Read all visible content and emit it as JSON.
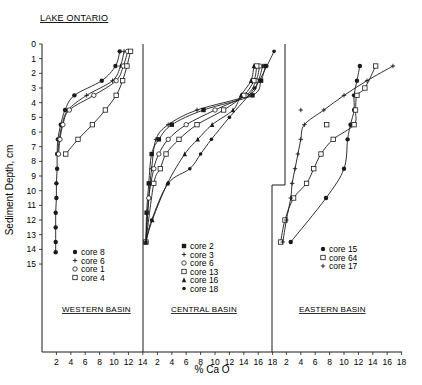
{
  "chart_data": {
    "type": "line",
    "title": "LAKE ONTARIO",
    "xlabel": "% Ca O",
    "ylabel": "Sediment Depth, cm",
    "y_ticks": [
      "0",
      "1",
      "2",
      "3",
      "4",
      "5",
      "6",
      "7",
      "8",
      "9",
      "10",
      "11",
      "12",
      "13",
      "14",
      "15"
    ],
    "ylim": [
      0,
      15
    ],
    "y_inverted": true,
    "grid": false,
    "panels": [
      {
        "name": "WESTERN BASIN",
        "x_ticks": [
          "2",
          "4",
          "6",
          "8",
          "10",
          "12",
          "14"
        ],
        "xlim": [
          0,
          14
        ],
        "series": [
          {
            "name": "core 8",
            "marker": "filled-circle",
            "points": [
              [
                10.8,
                0.5
              ],
              [
                10.2,
                1.5
              ],
              [
                8.3,
                2.5
              ],
              [
                4.5,
                3.5
              ],
              [
                3.2,
                4.5
              ],
              [
                2.6,
                5.5
              ],
              [
                2.2,
                6.5
              ],
              [
                2.1,
                7.5
              ],
              [
                2.1,
                8.5
              ],
              [
                2.0,
                9.5
              ],
              [
                2.0,
                10.5
              ],
              [
                1.9,
                11.5
              ],
              [
                1.9,
                12.5
              ],
              [
                1.9,
                13.5
              ],
              [
                1.9,
                14.2
              ]
            ]
          },
          {
            "name": "core 6",
            "marker": "plus",
            "points": [
              [
                11.4,
                0.5
              ],
              [
                10.9,
                1.5
              ],
              [
                9.8,
                2.5
              ],
              [
                6.2,
                3.5
              ],
              [
                3.6,
                4.5
              ],
              [
                2.8,
                5.5
              ],
              [
                2.4,
                6.5
              ],
              [
                2.2,
                7.5
              ]
            ]
          },
          {
            "name": "core 1",
            "marker": "open-circle",
            "points": [
              [
                11.9,
                0.5
              ],
              [
                11.3,
                1.5
              ],
              [
                10.3,
                2.5
              ],
              [
                7.2,
                3.5
              ],
              [
                3.8,
                4.5
              ],
              [
                2.9,
                5.5
              ],
              [
                2.5,
                6.5
              ],
              [
                2.3,
                7.5
              ]
            ]
          },
          {
            "name": "core 4",
            "marker": "open-square",
            "points": [
              [
                12.3,
                0.5
              ],
              [
                11.8,
                1.5
              ],
              [
                11.2,
                2.5
              ],
              [
                10.3,
                3.5
              ],
              [
                8.8,
                4.5
              ],
              [
                7.0,
                5.5
              ],
              [
                5.0,
                6.5
              ],
              [
                3.3,
                7.5
              ]
            ]
          }
        ]
      },
      {
        "name": "CENTRAL BASIN",
        "x_ticks": [
          "2",
          "4",
          "6",
          "8",
          "10",
          "12",
          "14",
          "16",
          "18"
        ],
        "xlim": [
          0,
          18
        ],
        "series": [
          {
            "name": "core 2",
            "marker": "filled-square",
            "points": [
              [
                17.0,
                1.5
              ],
              [
                16.4,
                2.5
              ],
              [
                15.2,
                3.5
              ],
              [
                8.4,
                4.5
              ],
              [
                4.0,
                5.5
              ],
              [
                2.2,
                6.5
              ],
              [
                1.2,
                7.5
              ],
              [
                0.8,
                9.5
              ],
              [
                0.5,
                11.5
              ],
              [
                0.4,
                13.5
              ]
            ]
          },
          {
            "name": "core 3",
            "marker": "plus",
            "points": [
              [
                16.6,
                1.5
              ],
              [
                16.0,
                2.5
              ],
              [
                14.6,
                3.5
              ],
              [
                7.5,
                4.5
              ],
              [
                3.5,
                5.5
              ],
              [
                1.8,
                6.5
              ],
              [
                1.2,
                8.5
              ],
              [
                0.8,
                10.5
              ],
              [
                0.4,
                13.5
              ]
            ]
          },
          {
            "name": "core 6",
            "marker": "open-circle",
            "points": [
              [
                16.2,
                1.5
              ],
              [
                15.7,
                2.5
              ],
              [
                14.3,
                3.5
              ],
              [
                10.0,
                4.5
              ],
              [
                6.0,
                5.5
              ],
              [
                3.5,
                6.5
              ],
              [
                2.2,
                7.5
              ],
              [
                1.5,
                8.5
              ],
              [
                0.8,
                10.5
              ],
              [
                0.4,
                13.5
              ]
            ]
          },
          {
            "name": "core 13",
            "marker": "open-square",
            "points": [
              [
                15.8,
                1.5
              ],
              [
                15.4,
                2.5
              ],
              [
                14.0,
                3.5
              ],
              [
                11.2,
                4.5
              ],
              [
                7.5,
                5.5
              ],
              [
                5.0,
                6.5
              ],
              [
                3.2,
                7.5
              ],
              [
                2.4,
                8.5
              ],
              [
                1.5,
                9.5
              ],
              [
                0.4,
                13.5
              ]
            ]
          },
          {
            "name": "core 16",
            "marker": "triangle",
            "points": [
              [
                15.4,
                1.5
              ],
              [
                15.0,
                2.5
              ],
              [
                13.6,
                3.5
              ],
              [
                12.5,
                4.5
              ],
              [
                9.6,
                5.5
              ],
              [
                7.6,
                6.5
              ],
              [
                5.8,
                7.5
              ],
              [
                3.4,
                9.5
              ],
              [
                1.3,
                12.0
              ],
              [
                0.4,
                13.5
              ]
            ]
          },
          {
            "name": "core 18",
            "marker": "asterisk",
            "points": [
              [
                18.2,
                0.5
              ],
              [
                17.2,
                1.5
              ],
              [
                15.5,
                3.0
              ],
              [
                12.0,
                5.0
              ],
              [
                9.5,
                6.5
              ],
              [
                8.0,
                7.5
              ],
              [
                6.5,
                8.5
              ],
              [
                3.5,
                9.5
              ],
              [
                1.2,
                12.0
              ],
              [
                0.4,
                13.5
              ]
            ]
          }
        ]
      },
      {
        "name": "EASTERN BASIN",
        "x_ticks": [
          "2",
          "4",
          "6",
          "8",
          "10",
          "12",
          "14",
          "16",
          "18"
        ],
        "xlim": [
          0,
          18
        ],
        "series": [
          {
            "name": "core 15",
            "marker": "filled-circle",
            "points": [
              [
                12.2,
                1.5
              ],
              [
                11.8,
                2.5
              ],
              [
                11.4,
                3.5
              ],
              [
                11.4,
                4.5
              ],
              [
                10.9,
                5.5
              ],
              [
                10.5,
                6.5
              ],
              [
                10.0,
                8.5
              ],
              [
                7.5,
                10.5
              ],
              [
                2.6,
                13.5
              ]
            ]
          },
          {
            "name": "core 64",
            "marker": "open-square",
            "points": [
              [
                14.4,
                1.5
              ],
              [
                12.9,
                3.0
              ],
              [
                11.8,
                3.5
              ],
              [
                11.6,
                4.5
              ],
              [
                11.4,
                5.5
              ],
              [
                8.5,
                6.5
              ],
              [
                6.8,
                7.5
              ],
              [
                5.8,
                8.5
              ],
              [
                4.8,
                9.5
              ],
              [
                3.0,
                10.5
              ],
              [
                1.8,
                12.0
              ],
              [
                1.2,
                13.5
              ]
            ]
          },
          {
            "name": "core 17",
            "marker": "plus",
            "points": [
              [
                16.8,
                1.5
              ],
              [
                13.2,
                2.5
              ],
              [
                10.0,
                3.5
              ],
              [
                7.2,
                4.5
              ],
              [
                4.5,
                5.5
              ],
              [
                4.0,
                6.5
              ],
              [
                3.6,
                7.5
              ],
              [
                3.2,
                8.5
              ],
              [
                2.8,
                9.5
              ],
              [
                2.6,
                10.5
              ],
              [
                2.0,
                12.0
              ],
              [
                1.5,
                13.5
              ]
            ]
          }
        ],
        "extra_points": [
          {
            "marker": "plus",
            "x": 4.0,
            "y": 4.5
          },
          {
            "marker": "open-square",
            "x": 7.6,
            "y": 5.5
          }
        ]
      }
    ]
  },
  "labels": {
    "title": "LAKE ONTARIO",
    "ylabel": "Sediment Depth, cm",
    "xlabel": "% Ca O",
    "west_basin": "WESTERN BASIN",
    "central_basin": "CENTRAL BASIN",
    "east_basin": "EASTERN BASIN",
    "west_legend": [
      "core 8",
      "core 6",
      "core 1",
      "core 4"
    ],
    "central_legend": [
      "core 2",
      "core 3",
      "core 6",
      "core 13",
      "core 16",
      "core 18"
    ],
    "east_legend": [
      "core 15",
      "core 64",
      "core 17"
    ]
  },
  "colors": {
    "ink": "#1a1a1a",
    "background": "#ffffff"
  }
}
